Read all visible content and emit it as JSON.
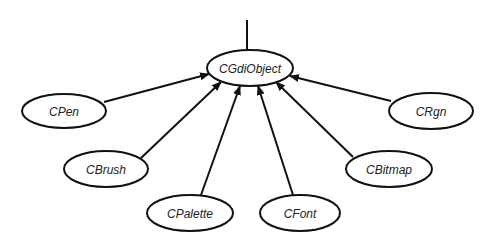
{
  "diagram": {
    "type": "class-hierarchy",
    "root": {
      "id": "cgdiobject",
      "label": "CGdiObject",
      "cx": 250,
      "cy": 68,
      "rx": 43,
      "ry": 18
    },
    "root_stem": {
      "x1": 247,
      "y1": 20,
      "x2": 247,
      "y2": 50
    },
    "children": [
      {
        "id": "cpen",
        "label": "CPen",
        "cx": 64,
        "cy": 111,
        "rx": 42,
        "ry": 17,
        "edge": {
          "x1": 104,
          "y1": 102,
          "x2": 209,
          "y2": 74
        }
      },
      {
        "id": "cbrush",
        "label": "CBrush",
        "cx": 106,
        "cy": 169,
        "rx": 42,
        "ry": 18,
        "edge": {
          "x1": 141,
          "y1": 158,
          "x2": 221,
          "y2": 82
        }
      },
      {
        "id": "cpalette",
        "label": "CPalette",
        "cx": 190,
        "cy": 213,
        "rx": 43,
        "ry": 18,
        "edge": {
          "x1": 201,
          "y1": 195,
          "x2": 240,
          "y2": 86
        }
      },
      {
        "id": "cfont",
        "label": "CFont",
        "cx": 300,
        "cy": 213,
        "rx": 40,
        "ry": 18,
        "edge": {
          "x1": 293,
          "y1": 195,
          "x2": 258,
          "y2": 86
        }
      },
      {
        "id": "cbitmap",
        "label": "CBitmap",
        "cx": 389,
        "cy": 169,
        "rx": 43,
        "ry": 18,
        "edge": {
          "x1": 353,
          "y1": 157,
          "x2": 276,
          "y2": 82
        }
      },
      {
        "id": "crgn",
        "label": "CRgn",
        "cx": 431,
        "cy": 111,
        "rx": 42,
        "ry": 18,
        "edge": {
          "x1": 391,
          "y1": 101,
          "x2": 290,
          "y2": 76
        }
      }
    ],
    "colors": {
      "stroke": "#111111",
      "fill": "#ffffff",
      "text": "#222222",
      "background": "#ffffff"
    }
  }
}
